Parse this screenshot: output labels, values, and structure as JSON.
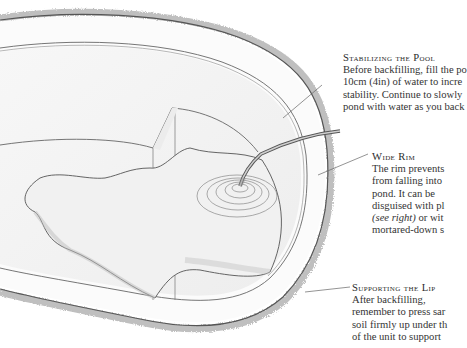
{
  "figure": {
    "colors": {
      "line": "#555555",
      "soil": "#9a9a9a",
      "shade": "#d9d9d9",
      "text": "#333333"
    }
  },
  "callouts": [
    {
      "id": "stabilizing-the-pool",
      "heading": "Stabilizing the Pool",
      "lines": [
        "Before backfilling, fill the po",
        "10cm (4in) of water to incre",
        "stability. Continue to slowly",
        "pond with water as you back"
      ]
    },
    {
      "id": "wide-rim",
      "heading": "Wide Rim",
      "lines": [
        "The rim prevents",
        "from falling into",
        "pond. It can be",
        "disguised with pl"
      ],
      "line5_italic": "(see right)",
      "line5_rest": " or wit",
      "line6": "mortared-down s"
    },
    {
      "id": "supporting-the-lip",
      "heading": "Supporting the Lip",
      "lines": [
        "After backfilling,",
        "remember to press sar",
        "soil firmly up under th",
        "of the unit to support"
      ]
    }
  ]
}
